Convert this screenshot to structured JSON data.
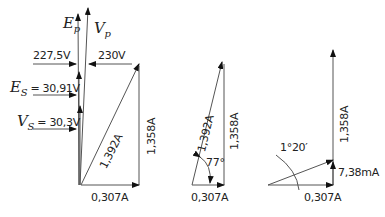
{
  "diagram": {
    "type": "phasor diagrams",
    "left": {
      "primary_emf_label": "E",
      "primary_emf_sub": "p",
      "primary_voltage_label": "V",
      "primary_voltage_sub": "p",
      "ep_value": "227,5V",
      "vp_value": "230V",
      "es_label": "E",
      "es_sub": "S",
      "es_value": "= 30,91V",
      "vs_label": "V",
      "vs_sub": "S",
      "vs_value": "= 30,3V",
      "resultant_current": "1,392A",
      "vertical_current": "1,358A",
      "horizontal_current": "0,307A"
    },
    "middle": {
      "resultant_current": "1,392A",
      "vertical_current": "1,358A",
      "horizontal_current": "0,307A",
      "angle": "77°"
    },
    "right": {
      "vertical_current": "1,358A",
      "horizontal_current": "0,307A",
      "small_current": "7,38mA",
      "angle": "1°20′"
    }
  }
}
